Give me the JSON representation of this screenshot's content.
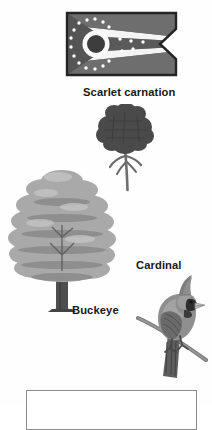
{
  "page": {
    "background_color": "#fefefe",
    "text_color": "#181818"
  },
  "labels": {
    "flower": "Scarlet carnation",
    "tree": "Buckeye",
    "bird": "Cardinal"
  },
  "figures": {
    "flag": {
      "icon": "ohio-burgee-flag-icon",
      "description": "Ohio state flag, swallowtail burgee with circle and stars",
      "colors": {
        "field": "#6e6e6e",
        "stripe_light": "#f2f2f2",
        "stripe_dark": "#555555",
        "disc_ring": "#ffffff",
        "disc_center": "#3d3d3d",
        "outline": "#2b2b2b"
      },
      "star_count": 17
    },
    "flower": {
      "icon": "carnation-flower-icon",
      "description": "Scarlet carnation bloom with stem and leaves",
      "colors": {
        "bloom": "#4a4a4a",
        "stem": "#6a6a6a"
      }
    },
    "tree": {
      "icon": "buckeye-tree-icon",
      "description": "Buckeye tree with broad layered canopy and trunk",
      "colors": {
        "canopy": "#a8a8a8",
        "canopy_shadow": "#8a8a8a",
        "trunk": "#4f4f4f"
      }
    },
    "bird": {
      "icon": "cardinal-bird-icon",
      "description": "Cardinal perched on a branch, crest raised",
      "colors": {
        "body": "#8f8f8f",
        "wing": "#6b6b6b",
        "face_mask": "#2e2e2e",
        "beak": "#bdbdbd",
        "branch": "#777777"
      }
    }
  },
  "answer_box": {
    "value": "",
    "placeholder": "",
    "border_color": "#8c8c8c"
  }
}
